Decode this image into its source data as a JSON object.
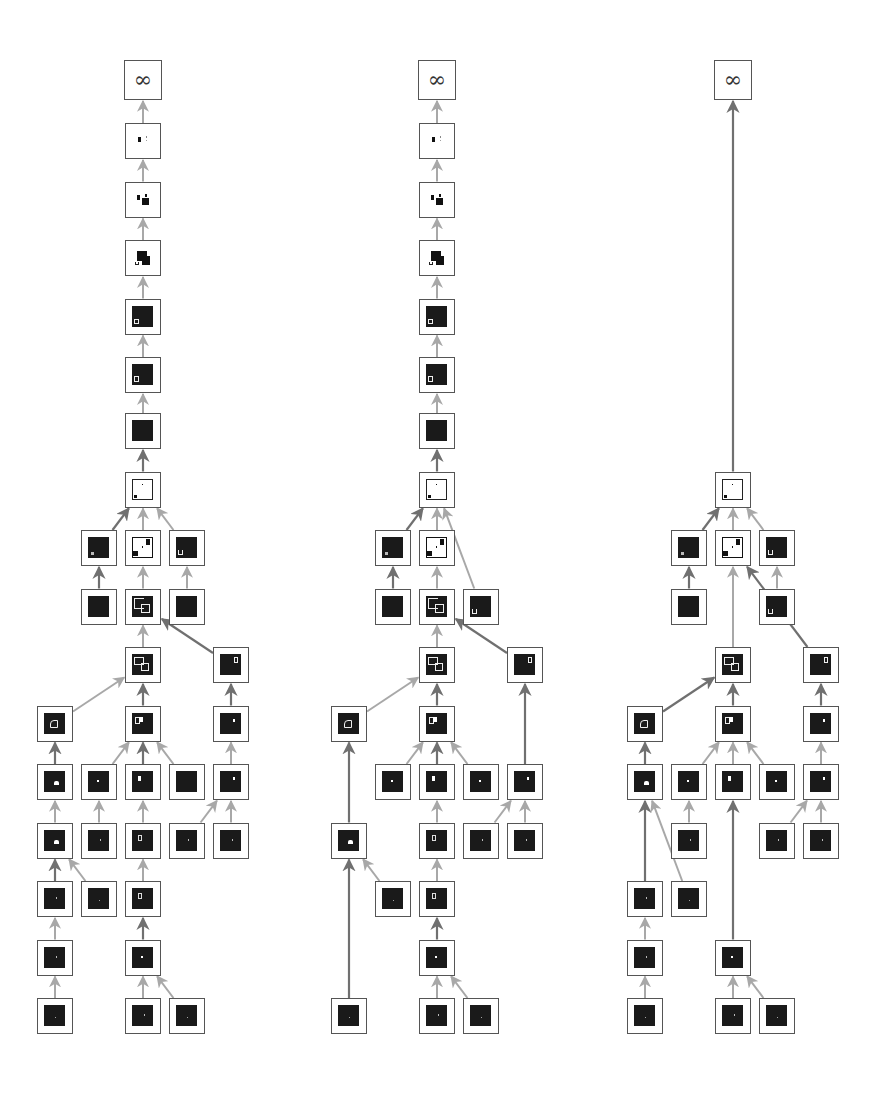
{
  "diagram": {
    "type": "tree-diagram",
    "root_label": "∞",
    "colors": {
      "node_border": "#555555",
      "thumb_dark": "#1a1a1a",
      "edge_light": "#a8a8a8",
      "edge_dark": "#707070",
      "background": "#ffffff"
    },
    "panels": [
      {
        "id": "left",
        "label": "∞",
        "node_count": 36
      },
      {
        "id": "middle",
        "label": "∞",
        "node_count": 33
      },
      {
        "id": "right",
        "label": "∞",
        "node_count": 25
      }
    ]
  }
}
